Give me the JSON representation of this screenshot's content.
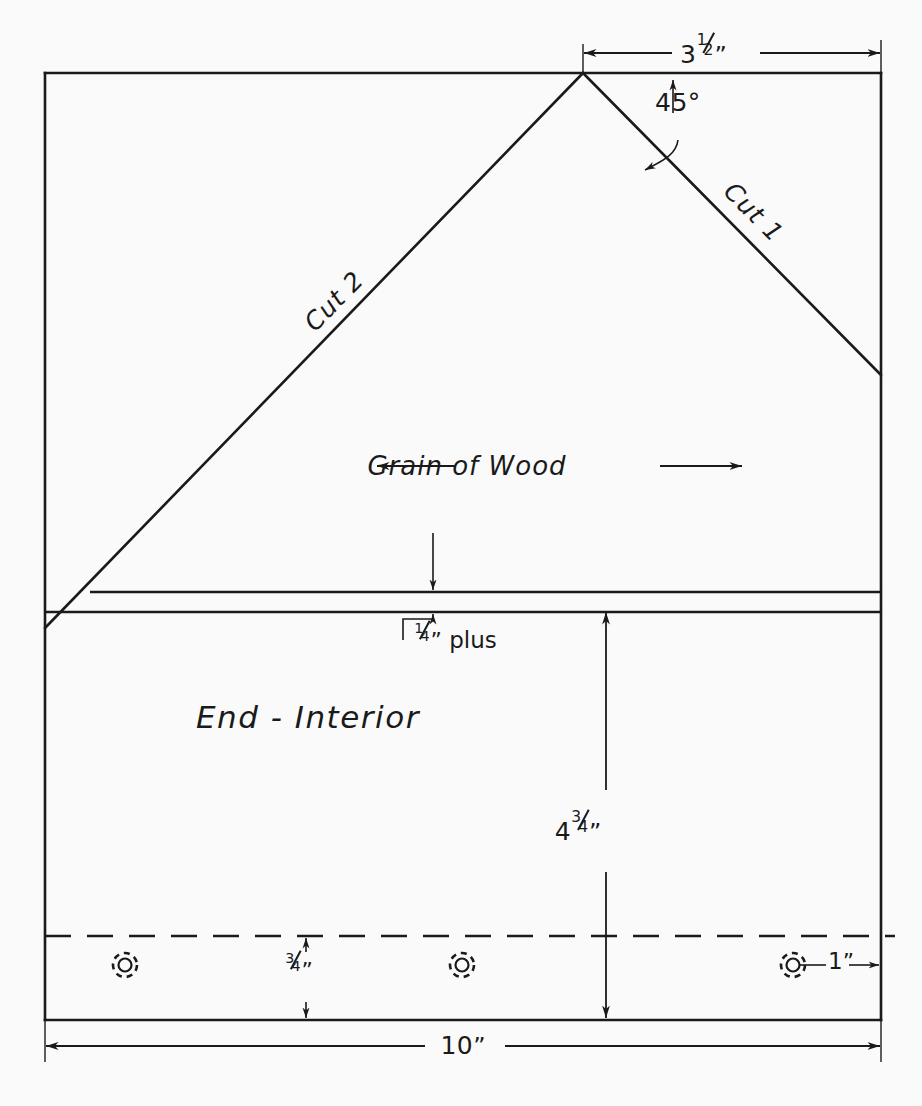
{
  "drawing": {
    "title": "End - Interior woodworking cut diagram",
    "background_color": "#fafafa",
    "line_color": "#1a1a1a",
    "part_label": "End - Interior",
    "grain_label": "Grain of Wood",
    "cut_labels": {
      "cut1": "Cut 1",
      "cut2": "Cut 2"
    },
    "dimensions": {
      "top_width": {
        "value": "3",
        "fraction_num": "1",
        "fraction_den": "2",
        "unit": "”",
        "display": "3½”"
      },
      "apex_angle": {
        "display": "45°"
      },
      "band_thickness": {
        "value": "",
        "fraction_num": "1",
        "fraction_den": "4",
        "unit": "”",
        "suffix": "plus",
        "display": "¼” plus"
      },
      "interior_height": {
        "value": "4",
        "fraction_num": "3",
        "fraction_den": "4",
        "unit": "”",
        "display": "4¾”"
      },
      "screw_line_offset": {
        "value": "",
        "fraction_num": "3",
        "fraction_den": "4",
        "unit": "”",
        "display": "¾”"
      },
      "edge_offset": {
        "value": "1",
        "unit": "”",
        "display": "1”"
      },
      "overall_width": {
        "value": "10",
        "unit": "”",
        "display": "10”"
      }
    },
    "features": {
      "screw_symbol_name": "screw-hole-icon",
      "screw_count": 3,
      "dashed_line_name": "screw-centerline",
      "board_band_name": "quarter-inch-band"
    },
    "geometry": {
      "rect": {
        "left": 45,
        "top": 73,
        "right": 881,
        "bottom": 1020
      },
      "apex": {
        "x": 583,
        "y": 73
      },
      "cut1_end": {
        "x": 881,
        "y": 375
      },
      "cut2_end": {
        "x": 45,
        "y": 628
      },
      "band_top_y": 592,
      "band_bottom_y": 612,
      "dashed_y": 936,
      "screws_x": [
        125,
        462,
        793
      ],
      "screws_y": 965
    }
  }
}
